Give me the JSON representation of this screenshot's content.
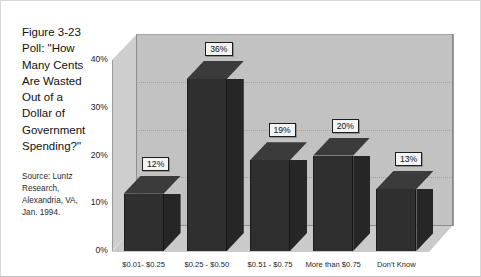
{
  "caption": {
    "title_lines": [
      "Figure 3-23",
      "Poll: \"How",
      "Many Cents",
      "Are Wasted",
      "Out of a",
      "Dollar of",
      "Government",
      "Spending?\""
    ],
    "source_lines": [
      "Source: Luntz",
      "Research,",
      "Alexandria, VA,",
      "Jan. 1994."
    ]
  },
  "colors": {
    "bar_front": "#2f2f2f",
    "bar_top": "#3b3b3b",
    "bar_side": "#262626",
    "wall": "#c2c2c2",
    "floor": "#cacaca",
    "side_panel": "#cecece",
    "label_box": "#f4f4f4",
    "text": "#111111"
  },
  "chart_data": {
    "type": "bar",
    "title": "Figure 3-23 Poll: \"How Many Cents Are Wasted Out of a Dollar of Government Spending?\"",
    "subtitle": "Source: Luntz Research, Alexandria, VA, Jan. 1994.",
    "xlabel": "",
    "ylabel": "",
    "categories": [
      "$0.01- $0.25",
      "$0.25 - $0.50",
      "$0.51 - $0.75",
      "More than $0.75",
      "Don't Know"
    ],
    "values": [
      12,
      36,
      19,
      20,
      13
    ],
    "data_labels": [
      "12%",
      "36%",
      "19%",
      "20%",
      "13%"
    ],
    "ylim": [
      0,
      40
    ],
    "yticks": [
      0,
      10,
      20,
      30,
      40
    ],
    "ytick_labels": [
      "0%",
      "10%",
      "20%",
      "30%",
      "40%"
    ],
    "grid": true,
    "grid_axis": "y",
    "legend": false,
    "legend_position": "none",
    "three_d": true,
    "annotations": []
  }
}
